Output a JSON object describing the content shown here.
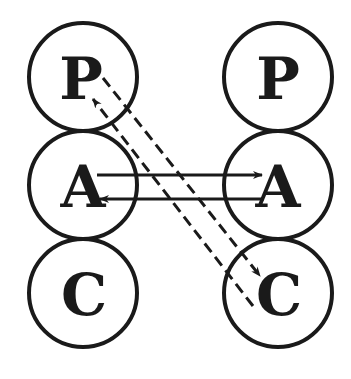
{
  "diagram": {
    "type": "transactional-analysis-ego-states",
    "colors": {
      "ink": "#1a1a1a",
      "background": "#ffffff"
    },
    "left_person": {
      "states": [
        {
          "label": "P",
          "cx": 83,
          "cy": 77
        },
        {
          "label": "A",
          "cx": 83,
          "cy": 185
        },
        {
          "label": "C",
          "cx": 83,
          "cy": 293
        }
      ]
    },
    "right_person": {
      "states": [
        {
          "label": "P",
          "cx": 278,
          "cy": 77
        },
        {
          "label": "A",
          "cx": 278,
          "cy": 185
        },
        {
          "label": "C",
          "cx": 278,
          "cy": 293
        }
      ]
    },
    "radius": 54,
    "transactions": [
      {
        "from": "left.A",
        "to": "right.A",
        "style": "solid"
      },
      {
        "from": "right.A",
        "to": "left.A",
        "style": "solid"
      },
      {
        "from": "left.P",
        "to": "right.C",
        "style": "dashed"
      },
      {
        "from": "right.C",
        "to": "left.P",
        "style": "dashed"
      }
    ]
  }
}
